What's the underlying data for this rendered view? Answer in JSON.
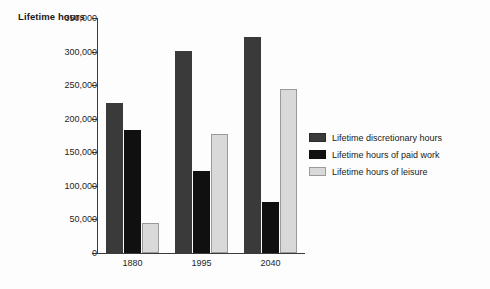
{
  "chart_data": {
    "type": "bar",
    "title": "",
    "ylabel": "Lifetime hours",
    "xlabel": "",
    "categories": [
      "1880",
      "1995",
      "2040"
    ],
    "series": [
      {
        "name": "Lifetime discretionary hours",
        "color": "#3a3a3a",
        "values": [
          224000,
          301000,
          322000
        ]
      },
      {
        "name": "Lifetime hours of paid work",
        "color": "#101010",
        "values": [
          183000,
          122000,
          76000
        ]
      },
      {
        "name": "Lifetime hours of leisure",
        "color": "#d9d9d9",
        "values": [
          45000,
          177000,
          245000
        ]
      }
    ],
    "ylim": [
      0,
      350000
    ],
    "ytick_values": [
      0,
      50000,
      100000,
      150000,
      200000,
      250000,
      300000,
      350000
    ],
    "ytick_labels": [
      "0",
      "50,000",
      "100,000",
      "150,000",
      "200,000",
      "250,000",
      "300,000",
      "350,000"
    ],
    "grid": false,
    "legend_position": "right"
  }
}
